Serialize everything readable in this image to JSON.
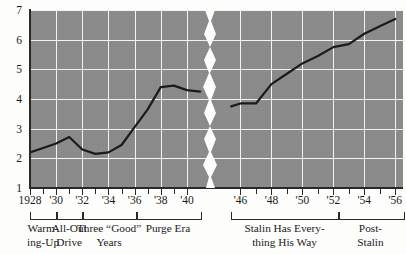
{
  "chart_data": {
    "type": "line",
    "title": "",
    "subtitle": "",
    "xlabel": "",
    "ylabel": "",
    "grid": true,
    "legend": false,
    "axis_break": {
      "present": true,
      "between": [
        "1941",
        "1945"
      ],
      "style": "jagged white band"
    },
    "ylim": [
      1,
      7
    ],
    "yticks": [
      1,
      2,
      3,
      4,
      5,
      6,
      7
    ],
    "ytick_labels": [
      "1",
      "2",
      "3",
      "4",
      "5",
      "6",
      "7"
    ],
    "xlim_left": [
      1928,
      1941
    ],
    "xlim_right": [
      1945,
      1956.5
    ],
    "xticks_left": [
      1928,
      1929,
      1930,
      1931,
      1932,
      1933,
      1934,
      1935,
      1936,
      1937,
      1938,
      1939,
      1940
    ],
    "xticks_right": [
      1946,
      1947,
      1948,
      1949,
      1950,
      1951,
      1952,
      1953,
      1954,
      1955,
      1956
    ],
    "xtick_labels": [
      {
        "x": 1928,
        "label": "1928"
      },
      {
        "x": 1930,
        "label": "'30"
      },
      {
        "x": 1932,
        "label": "'32"
      },
      {
        "x": 1934,
        "label": "'34"
      },
      {
        "x": 1936,
        "label": "'36"
      },
      {
        "x": 1938,
        "label": "'38"
      },
      {
        "x": 1940,
        "label": "'40"
      },
      {
        "x": 1946,
        "label": "'46"
      },
      {
        "x": 1948,
        "label": "'48"
      },
      {
        "x": 1950,
        "label": "'50"
      },
      {
        "x": 1952,
        "label": "'52"
      },
      {
        "x": 1954,
        "label": "'54"
      },
      {
        "x": 1956,
        "label": "'56"
      }
    ],
    "gridlines_x": [
      1930,
      1932,
      1934,
      1936,
      1938,
      1940,
      1946,
      1948,
      1950,
      1952,
      1954,
      1956
    ],
    "gridlines_y": [
      2,
      3,
      4,
      5,
      6,
      7
    ],
    "series": [
      {
        "name": "segment-prewar",
        "x": [
          1928,
          1929,
          1930,
          1931,
          1932,
          1933,
          1934,
          1935,
          1936,
          1937,
          1938,
          1939,
          1940,
          1941
        ],
        "values": [
          2.2,
          2.35,
          2.5,
          2.72,
          2.3,
          2.15,
          2.2,
          2.45,
          3.05,
          3.65,
          4.4,
          4.45,
          4.3,
          4.25
        ]
      },
      {
        "name": "segment-postwar",
        "x": [
          1945.4,
          1946,
          1947,
          1948,
          1949,
          1950,
          1951,
          1952,
          1953,
          1954,
          1955,
          1956
        ],
        "values": [
          3.75,
          3.85,
          3.85,
          4.5,
          4.85,
          5.2,
          5.45,
          5.75,
          5.85,
          6.2,
          6.45,
          6.7
        ]
      }
    ],
    "colors": {
      "plot_background": "#8a8a8a",
      "gridline": "#f2f2f2",
      "data_line": "#1b1b1b",
      "axis": "#2a2a2a",
      "page_background": "#fdfdfb",
      "text": "#1b1b1b"
    },
    "eras": [
      {
        "label": "Warm-\ning-Up",
        "start": 1928,
        "end": 1930
      },
      {
        "label": "All-Out\nDrive",
        "start": 1930,
        "end": 1932
      },
      {
        "label": "Three “Good”\nYears",
        "start": 1932,
        "end": 1936.1
      },
      {
        "label": "Purge Era",
        "start": 1936.1,
        "end": 1941
      },
      {
        "label": "Stalin Has Every-\nthing His Way",
        "start": 1945.4,
        "end": 1952.3
      },
      {
        "label": "Post-\nStalin",
        "start": 1952.3,
        "end": 1956.5
      }
    ]
  }
}
